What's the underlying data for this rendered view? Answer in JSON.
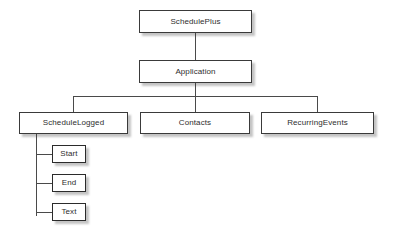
{
  "diagram": {
    "type": "hierarchy-tree",
    "background_color": "#ffffff",
    "box_fill_color": "#ffffff",
    "box_border_color": "#3a3a3a",
    "connector_color": "#4a4a4a",
    "text_color": "#2e2e2e",
    "nodes": {
      "root": {
        "label": "SchedulePlus"
      },
      "application": {
        "label": "Application"
      },
      "schedule_logged": {
        "label": "ScheduleLogged"
      },
      "contacts": {
        "label": "Contacts"
      },
      "recurring_events": {
        "label": "RecurringEvents"
      },
      "start": {
        "label": "Start"
      },
      "end": {
        "label": "End"
      },
      "text": {
        "label": "Text"
      }
    },
    "edges": [
      {
        "from": "SchedulePlus",
        "to": "Application"
      },
      {
        "from": "Application",
        "to": "ScheduleLogged"
      },
      {
        "from": "Application",
        "to": "Contacts"
      },
      {
        "from": "Application",
        "to": "RecurringEvents"
      },
      {
        "from": "ScheduleLogged",
        "to": "Start"
      },
      {
        "from": "ScheduleLogged",
        "to": "End"
      },
      {
        "from": "ScheduleLogged",
        "to": "Text"
      }
    ]
  }
}
